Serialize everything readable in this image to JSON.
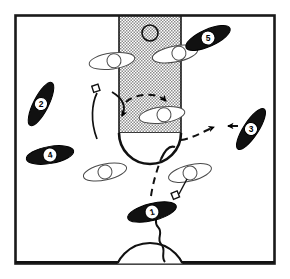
{
  "diagram": {
    "kind": "half-court-play",
    "background_color": "#ffffff",
    "ink_color": "#000000",
    "paint_fill_color": "#b0b0b0",
    "frame": {
      "x": 14,
      "y": 14,
      "width": 262,
      "height": 251,
      "stroke_width": 3
    }
  },
  "court": {
    "paint": {
      "x": 119,
      "y": 17,
      "width": 62,
      "height": 116,
      "label": "key"
    },
    "free_throw_arc": {
      "cx": 150,
      "cy": 133,
      "r": 31,
      "label": "free-throw-arc"
    },
    "rim_circle": {
      "cx": 150,
      "cy": 33,
      "r": 8,
      "label": "rim"
    },
    "center_circle": {
      "cx": 150,
      "cy": 279,
      "r": 36,
      "label": "center-circle"
    },
    "center_inner_circle": {
      "cx": 150,
      "cy": 279,
      "r": 12,
      "label": "center-inner-circle"
    },
    "half_court_line": {
      "x1": 14,
      "y1": 262,
      "x2": 276,
      "y2": 262,
      "label": "half-court-line"
    },
    "baseline": {
      "x1": 14,
      "y1": 17,
      "x2": 276,
      "y2": 17,
      "label": "baseline"
    }
  },
  "offense": [
    {
      "id": "1",
      "label": "1",
      "cx": 152,
      "cy": 212,
      "angle": -14,
      "rx": 25,
      "ry": 8
    },
    {
      "id": "2",
      "label": "2",
      "cx": 41,
      "cy": 104,
      "angle": -63,
      "rx": 24,
      "ry": 7.5
    },
    {
      "id": "3",
      "label": "3",
      "cx": 251,
      "cy": 129,
      "angle": -57,
      "rx": 24,
      "ry": 7.5
    },
    {
      "id": "4",
      "label": "4",
      "cx": 50,
      "cy": 155,
      "angle": -10,
      "rx": 24,
      "ry": 8
    },
    {
      "id": "5",
      "label": "5",
      "cx": 208,
      "cy": 38,
      "angle": -24,
      "rx": 24,
      "ry": 8
    }
  ],
  "defense": [
    {
      "id": "d1",
      "cx": 112,
      "cy": 61,
      "angle": -8,
      "rx": 23,
      "ry": 8,
      "circle_dx": 2,
      "circle_r": 7
    },
    {
      "id": "d2",
      "cx": 175,
      "cy": 54,
      "angle": -11,
      "rx": 23,
      "ry": 8,
      "circle_dx": 4,
      "circle_r": 7
    },
    {
      "id": "d3",
      "cx": 162,
      "cy": 115,
      "angle": -8,
      "rx": 23,
      "ry": 8,
      "circle_dx": 2,
      "circle_r": 7
    },
    {
      "id": "d4",
      "cx": 105,
      "cy": 172,
      "angle": -12,
      "rx": 22,
      "ry": 8,
      "circle_dx": 0,
      "circle_r": 7
    },
    {
      "id": "d5",
      "cx": 190,
      "cy": 173,
      "angle": -14,
      "rx": 22,
      "ry": 8,
      "circle_dx": 0,
      "circle_r": 7
    }
  ],
  "movement": {
    "cut_left_solid": "M 97,93 C 92,102 90,120 96,137",
    "cut_left_flag": {
      "x": 95,
      "y": 88,
      "size": 6
    },
    "screen_arrow_into_key": "M 116,95 C 124,100 128,106 121,117",
    "dashed_arc_in_key": "M 126,101 C 137,93 158,93 166,101",
    "pass_dashed_right": "M 180,135 C 196,135 208,128 218,125",
    "dribble_dashed_bottom": "M 151,192 C 153,178 157,168 160,158",
    "baseline_hook": "M 160,158 C 164,150 170,146 174,147",
    "defender_stick_right": "M 186,178 L 178,195",
    "defender_flag_right": {
      "x": 174,
      "y": 195,
      "size": 6
    },
    "dribble_squiggle_label": "dribble-squiggle",
    "arrowheads": [
      {
        "x": 121,
        "y": 118,
        "angle": 110,
        "label": "arrow-into-key"
      },
      {
        "x": 168,
        "y": 101,
        "angle": 35,
        "label": "arrow-dashed-arc"
      },
      {
        "x": 214,
        "y": 126,
        "angle": 348,
        "label": "arrow-pass-right"
      },
      {
        "x": 232,
        "y": 126,
        "angle": 180,
        "label": "arrow-player3-cut"
      },
      {
        "x": 152,
        "y": 228,
        "angle": 280,
        "label": "arrow-dribble-end"
      }
    ]
  },
  "legend": {
    "offense_marker": "black-lens-player",
    "defense_marker": "open-lens-defender",
    "screen_marker": "open-square-flag",
    "pass_line": "dashed",
    "dribble_line": "wavy",
    "cut_line": "solid"
  }
}
